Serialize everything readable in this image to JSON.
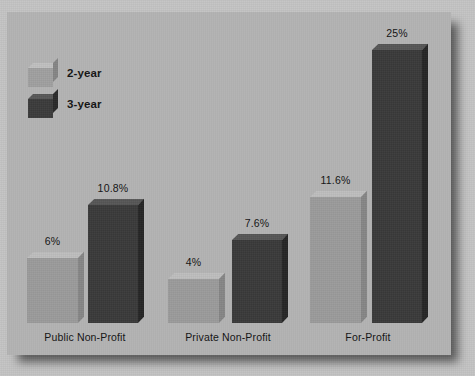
{
  "chart_data": {
    "type": "bar",
    "title": "",
    "subtitle": "",
    "xlabel": "",
    "ylabel": "",
    "grid": false,
    "legend_position": "top-left",
    "categories": [
      "Public Non-Profit",
      "Private Non-Profit",
      "For-Profit"
    ],
    "series": [
      {
        "name": "2-year",
        "color": "#9b9b9b",
        "values": [
          6,
          4,
          11.6
        ],
        "value_labels": [
          "6%",
          "4%",
          "11.6%"
        ]
      },
      {
        "name": "3-year",
        "color": "#3a3a3a",
        "values": [
          10.8,
          7.6,
          25
        ],
        "value_labels": [
          "10.8%",
          "7.6%",
          "25%"
        ]
      }
    ],
    "ylim": [
      0,
      26
    ],
    "units": "percent"
  },
  "legend": {
    "items": [
      {
        "label": "2-year",
        "swatch": "legend-cube-light"
      },
      {
        "label": "3-year",
        "swatch": "legend-cube-dark"
      }
    ]
  },
  "panel": {
    "background_color": "#b5b5b5",
    "page_background_color": "#c4c4c4"
  }
}
